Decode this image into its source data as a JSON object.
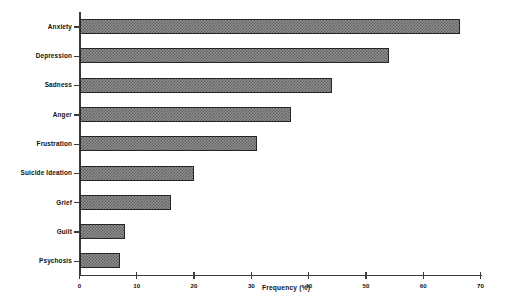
{
  "chart_data": {
    "type": "bar",
    "orientation": "horizontal",
    "title": "",
    "xlabel": "Frequency (%)",
    "ylabel": "",
    "xlim": [
      0,
      70
    ],
    "xticks": [
      0,
      10,
      20,
      30,
      40,
      50,
      60,
      70
    ],
    "grid": false,
    "legend": null,
    "categories": [
      "Anxiety",
      "Depression",
      "Sadness",
      "Anger",
      "Frustration",
      "Suicide Ideation",
      "Grief",
      "Guilt",
      "Psychosis"
    ],
    "values": [
      66.5,
      54,
      44,
      37,
      31,
      20,
      16,
      8,
      7
    ],
    "series": [
      {
        "name": "Frequency (%)",
        "values": [
          66.5,
          54,
          44,
          37,
          31,
          20,
          16,
          8,
          7
        ]
      }
    ],
    "bar_fill": "#8f8f8f",
    "bar_hatch_color": "#5c5c5c",
    "bar_border": "#262626",
    "axis_color": "#3a3a3a",
    "text_color": "#111111",
    "background": "#ffffff"
  }
}
